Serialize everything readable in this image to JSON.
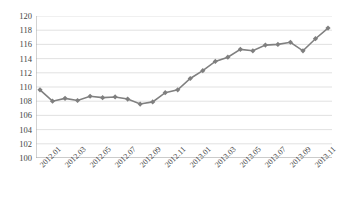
{
  "chart_data": {
    "type": "line",
    "title": "",
    "xlabel": "",
    "ylabel": "",
    "ylim": [
      100,
      120
    ],
    "ytick_step": 2,
    "yticks": [
      100,
      102,
      104,
      106,
      108,
      110,
      112,
      114,
      116,
      118,
      120
    ],
    "grid": true,
    "legend": "none",
    "marker": "diamond",
    "line_color": "#808080",
    "marker_color": "#7f7f7f",
    "grid_color": "#d9d9d9",
    "axis_color": "#a6a6a6",
    "x": [
      "2012.01",
      "2012.02",
      "2012.03",
      "2012.04",
      "2012.05",
      "2012.06",
      "2012.07",
      "2012.08",
      "2012.09",
      "2012.10",
      "2012.11",
      "2012.12",
      "2013.01",
      "2013.02",
      "2013.03",
      "2013.04",
      "2013.05",
      "2013.06",
      "2013.07",
      "2013.08",
      "2013.09",
      "2013.10",
      "2013.11",
      "2013.12"
    ],
    "xticklabels": [
      "2012.01",
      "",
      "2012.03",
      "",
      "2012.05",
      "",
      "2012.07",
      "",
      "2012.09",
      "",
      "2012.11",
      "",
      "2013.01",
      "",
      "2013.03",
      "",
      "2013.05",
      "",
      "2013.07",
      "",
      "2013.09",
      "",
      "2013.11",
      ""
    ],
    "values": [
      109.6,
      108.0,
      108.4,
      108.1,
      108.7,
      108.5,
      108.6,
      108.3,
      107.6,
      107.9,
      109.2,
      109.6,
      111.2,
      112.3,
      113.6,
      114.2,
      115.3,
      115.1,
      115.9,
      116.0,
      116.3,
      115.1,
      116.8,
      118.3
    ]
  }
}
